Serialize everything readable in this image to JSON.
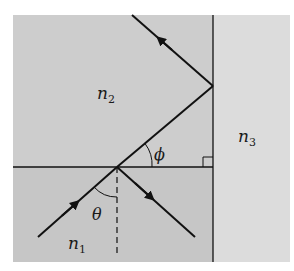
{
  "diagram": {
    "colors": {
      "background": "#ffffff",
      "region_n1": "#c9c9c9",
      "region_n2": "#cdcdcd",
      "region_n3": "#dcdcdc",
      "line": "#111111"
    },
    "labels": {
      "n1": {
        "base": "n",
        "sub": "1"
      },
      "n2": {
        "base": "n",
        "sub": "2"
      },
      "n3": {
        "base": "n",
        "sub": "3"
      },
      "theta": "θ",
      "phi": "ϕ"
    },
    "elements": [
      "horizontal interface n1|n2",
      "vertical interface n2|n3",
      "incident ray with arrow",
      "reflected ray into n1 with arrow",
      "refracted ray into n2",
      "ray reflected at n2|n3 with arrow",
      "dashed normal",
      "angle arc theta",
      "angle arc phi",
      "right-angle marker"
    ]
  }
}
